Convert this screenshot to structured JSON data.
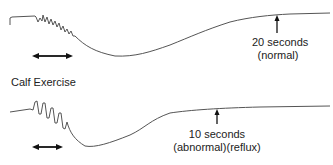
{
  "diagram": {
    "section_label": "Calf Exercise",
    "top_trace": {
      "name": "normal",
      "annotation_line1": "20 seconds",
      "annotation_line2": "(normal)"
    },
    "bottom_trace": {
      "name": "abnormal",
      "annotation_line1": "10 seconds",
      "annotation_line2": "(abnormal)(reflux)"
    },
    "colors": {
      "trace": "#555555",
      "arrow": "#111111",
      "text": "#222222"
    }
  }
}
